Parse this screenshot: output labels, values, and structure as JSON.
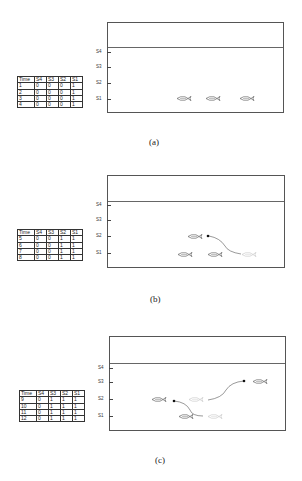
{
  "table_headers": [
    "Time",
    "S4",
    "S3",
    "S2",
    "S1"
  ],
  "panels": [
    {
      "caption": "(a)",
      "ticks": [
        "S4",
        "S3",
        "S2",
        "S1"
      ],
      "rows": [
        [
          "1",
          "0",
          "0",
          "0",
          "1"
        ],
        [
          "2",
          "0",
          "0",
          "0",
          "1"
        ],
        [
          "3",
          "0",
          "0",
          "0",
          "1"
        ],
        [
          "4",
          "0",
          "0",
          "0",
          "1"
        ]
      ]
    },
    {
      "caption": "(b)",
      "ticks": [
        "S4",
        "S3",
        "S2",
        "S1"
      ],
      "rows": [
        [
          "5",
          "0",
          "0",
          "1",
          "1"
        ],
        [
          "6",
          "0",
          "0",
          "1",
          "1"
        ],
        [
          "7",
          "0",
          "0",
          "1",
          "1"
        ],
        [
          "8",
          "0",
          "0",
          "1",
          "1"
        ]
      ]
    },
    {
      "caption": "(c)",
      "ticks": [
        "S4",
        "S3",
        "S2",
        "S1"
      ],
      "rows": [
        [
          "9",
          "0",
          "1",
          "1",
          "1"
        ],
        [
          "10",
          "0",
          "1",
          "1",
          "1"
        ],
        [
          "11",
          "0",
          "1",
          "1",
          "1"
        ],
        [
          "12",
          "0",
          "1",
          "1",
          "1"
        ]
      ]
    }
  ],
  "colors": {
    "fish_solid": "#666666",
    "fish_faded": "#cccccc",
    "line": "#555555"
  }
}
